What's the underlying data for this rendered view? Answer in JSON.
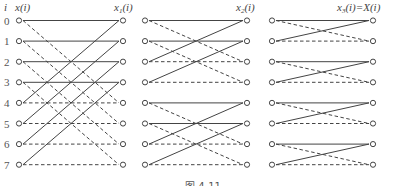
{
  "header": {
    "index_label": "i",
    "input_label": "x(i)",
    "stage1_label": "x1(i)",
    "stage2_label": "x2(i)",
    "stage3_label": "x3(i)=X(i)"
  },
  "rows": [
    "0",
    "1",
    "2",
    "3",
    "4",
    "5",
    "6",
    "7"
  ],
  "caption": "图 4-11",
  "stages": [
    {
      "name": "stage-1",
      "pairs": [
        [
          0,
          4
        ],
        [
          1,
          5
        ],
        [
          2,
          6
        ],
        [
          3,
          7
        ]
      ]
    },
    {
      "name": "stage-2",
      "pairs": [
        [
          0,
          2
        ],
        [
          1,
          3
        ],
        [
          4,
          6
        ],
        [
          5,
          7
        ]
      ]
    },
    {
      "name": "stage-3",
      "pairs": [
        [
          0,
          1
        ],
        [
          2,
          3
        ],
        [
          4,
          5
        ],
        [
          6,
          7
        ]
      ]
    }
  ],
  "colors": {
    "line": "#444444",
    "node": "#444444"
  }
}
